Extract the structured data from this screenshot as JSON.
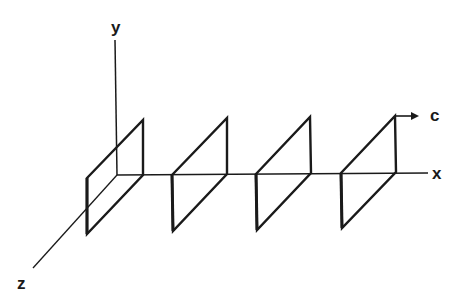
{
  "diagram": {
    "colors": {
      "stroke": "#1a1a1a",
      "background": "#ffffff"
    },
    "axes": {
      "y": {
        "label": "y"
      },
      "x": {
        "label": "x"
      },
      "z": {
        "label": "z"
      }
    },
    "arrow": {
      "label": "c"
    },
    "panels": [
      {
        "id": 1
      },
      {
        "id": 2
      },
      {
        "id": 3
      },
      {
        "id": 4
      }
    ]
  }
}
